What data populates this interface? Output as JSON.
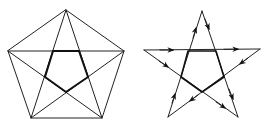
{
  "figure": {
    "left": {
      "name": "pentagon-with-star",
      "vertices": [
        [
          66,
          10
        ],
        [
          124,
          51
        ],
        [
          102,
          118
        ],
        [
          31,
          118
        ],
        [
          8,
          51
        ]
      ],
      "inner_pentagon": [
        [
          53,
          51
        ],
        [
          79,
          51
        ],
        [
          88,
          77
        ],
        [
          66,
          92
        ],
        [
          45,
          77
        ]
      ]
    },
    "right": {
      "name": "directed-pentagram",
      "vertices": {
        "top": [
          202,
          11
        ],
        "right": [
          260,
          49
        ],
        "bottom_right": [
          238,
          117
        ],
        "bottom_left": [
          168,
          117
        ],
        "left": [
          144,
          50
        ]
      },
      "edges": [
        {
          "from": "left",
          "to": "right"
        },
        {
          "from": "top",
          "to": "bottom_right"
        },
        {
          "from": "right",
          "to": "bottom_left"
        },
        {
          "from": "bottom_left",
          "to": "top"
        },
        {
          "from": "left",
          "to": "bottom_right"
        }
      ],
      "inner_pentagon": [
        [
          188,
          51
        ],
        [
          216,
          51
        ],
        [
          224,
          77
        ],
        [
          202,
          92
        ],
        [
          181,
          77
        ]
      ]
    },
    "colors": {
      "stroke": "#222222",
      "background": "#ffffff"
    }
  }
}
